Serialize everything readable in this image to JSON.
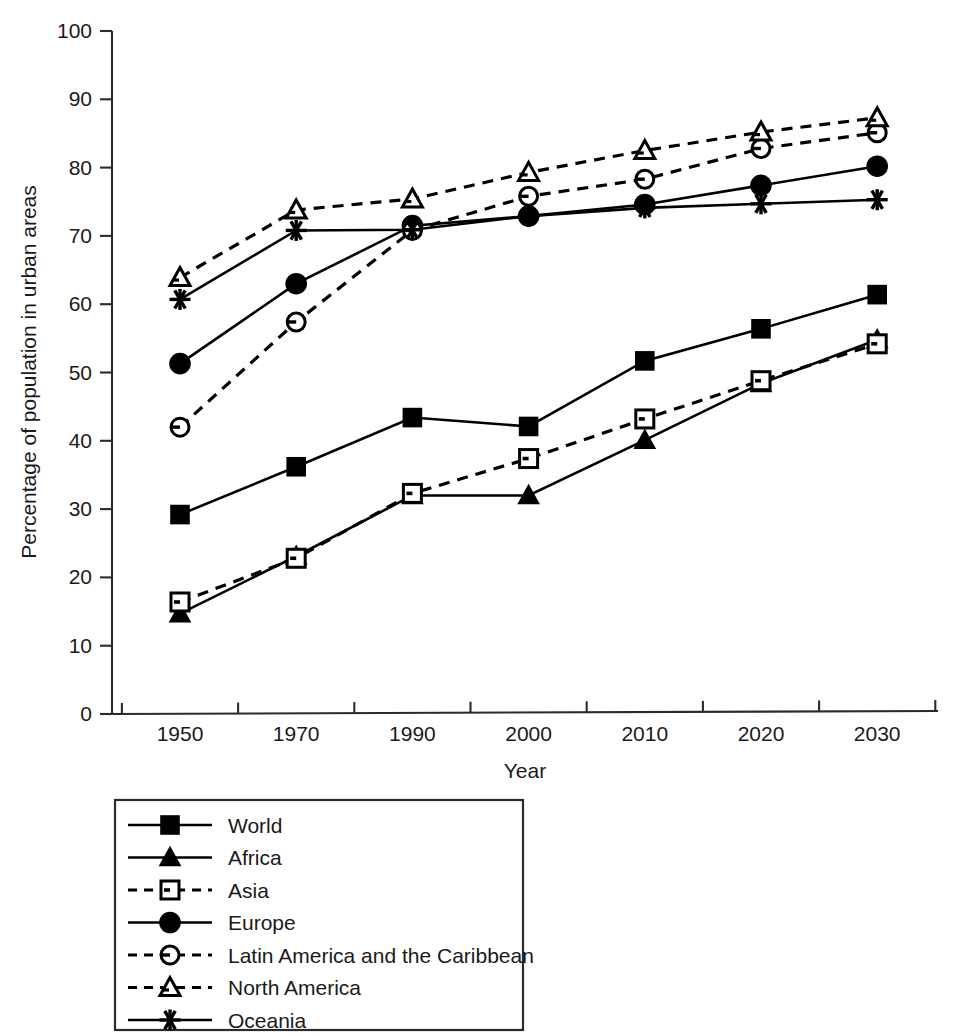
{
  "chart_data": {
    "type": "line",
    "title": "",
    "xlabel": "Year",
    "ylabel": "Percentage of population in urban areas",
    "categories": [
      "1950",
      "1970",
      "1990",
      "2000",
      "2010",
      "2020",
      "2030"
    ],
    "x_tick_labels": [
      "1950",
      "1970",
      "1990",
      "2000",
      "2010",
      "2020",
      "2030"
    ],
    "y_tick_labels": [
      "0",
      "10",
      "20",
      "30",
      "40",
      "50",
      "60",
      "70",
      "80",
      "90",
      "100"
    ],
    "y_ticks": [
      0,
      10,
      20,
      30,
      40,
      50,
      60,
      70,
      80,
      90,
      100
    ],
    "ylim": [
      0,
      100
    ],
    "grid": false,
    "legend_position": "below-plot",
    "series": [
      {
        "name": "World",
        "marker": "filled-square",
        "line_style": "solid",
        "values": [
          29.2,
          36.2,
          43.4,
          42.1,
          51.7,
          56.4,
          61.4
        ]
      },
      {
        "name": "Africa",
        "marker": "filled-triangle",
        "line_style": "solid",
        "values": [
          14.7,
          23.1,
          32.0,
          32.0,
          40.1,
          48.4,
          54.8
        ]
      },
      {
        "name": "Asia",
        "marker": "open-square",
        "line_style": "dashed",
        "values": [
          16.4,
          22.8,
          32.3,
          37.4,
          43.2,
          48.8,
          54.2
        ]
      },
      {
        "name": "Europe",
        "marker": "filled-circle",
        "line_style": "solid",
        "values": [
          51.3,
          63.0,
          71.5,
          72.9,
          74.6,
          77.4,
          80.2
        ]
      },
      {
        "name": "Latin America and the Caribbean",
        "marker": "open-circle",
        "line_style": "dashed",
        "values": [
          42.0,
          57.4,
          70.8,
          75.8,
          78.3,
          82.8,
          85.1
        ]
      },
      {
        "name": "North America",
        "marker": "open-triangle",
        "line_style": "dashed",
        "values": [
          63.9,
          73.8,
          75.4,
          79.3,
          82.5,
          85.2,
          87.3
        ]
      },
      {
        "name": "Oceania",
        "marker": "asterisk",
        "line_style": "solid",
        "values": [
          60.7,
          70.8,
          70.9,
          72.9,
          74.1,
          74.7,
          75.3
        ]
      }
    ]
  },
  "legend": {
    "items": [
      {
        "label": "World"
      },
      {
        "label": "Africa"
      },
      {
        "label": "Asia"
      },
      {
        "label": "Europe"
      },
      {
        "label": "Latin America and the Caribbean"
      },
      {
        "label": "North America"
      },
      {
        "label": "Oceania"
      }
    ]
  },
  "axes": {
    "x_title": "Year",
    "y_title": "Percentage of population in urban areas"
  },
  "colors": {
    "ink": "#000000",
    "axis": "#2b2b2b",
    "background": "#ffffff"
  }
}
